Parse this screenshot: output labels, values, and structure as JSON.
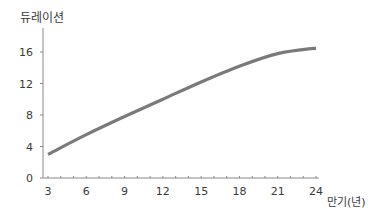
{
  "chart_data": {
    "type": "line",
    "title": "",
    "ylabel": "듀레이션",
    "xlabel": "만기(년)",
    "x_ticks": [
      3,
      6,
      9,
      12,
      15,
      18,
      21,
      24
    ],
    "y_ticks": [
      0,
      4,
      8,
      12,
      16
    ],
    "xlim": [
      3,
      24
    ],
    "ylim": [
      0,
      18
    ],
    "grid": false,
    "legend": null,
    "series": [
      {
        "name": "듀레이션",
        "color": "#7a7a7a",
        "x": [
          3,
          6,
          9,
          12,
          15,
          18,
          21,
          24
        ],
        "y": [
          3.0,
          5.5,
          7.8,
          10.0,
          12.2,
          14.2,
          15.8,
          16.5
        ]
      }
    ]
  },
  "labels": {
    "ylabel": "듀레이션",
    "xlabel": "만기(년)"
  }
}
